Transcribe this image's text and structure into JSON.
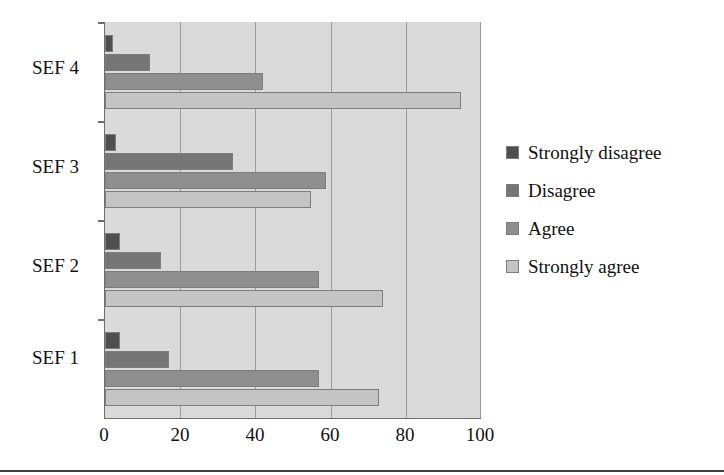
{
  "chart_data": {
    "type": "bar",
    "orientation": "horizontal",
    "title": "",
    "xlabel": "",
    "ylabel": "",
    "categories": [
      "SEF 1",
      "SEF 2",
      "SEF 3",
      "SEF 4"
    ],
    "category_order_top_to_bottom": [
      "SEF 4",
      "SEF 3",
      "SEF 2",
      "SEF 1"
    ],
    "series": [
      {
        "name": "Strongly disagree",
        "color": "#4f4f4f",
        "values": [
          4,
          4,
          3,
          2
        ]
      },
      {
        "name": "Disagree",
        "color": "#757575",
        "values": [
          17,
          15,
          34,
          12
        ]
      },
      {
        "name": "Agree",
        "color": "#8f8f8f",
        "values": [
          57,
          57,
          59,
          42
        ]
      },
      {
        "name": "Strongly agree",
        "color": "#c4c4c4",
        "values": [
          73,
          74,
          55,
          95
        ]
      }
    ],
    "xlim": [
      0,
      100
    ],
    "xticks": [
      0,
      20,
      40,
      60,
      80,
      100
    ],
    "xtick_labels": [
      "0",
      "20",
      "40",
      "60",
      "80",
      "100"
    ],
    "grid": true,
    "grid_axis": "x",
    "legend_position": "right",
    "plot_background": "#dadada",
    "axis_color": "#6f6f6f"
  },
  "legend": {
    "items": [
      {
        "label": "Strongly disagree"
      },
      {
        "label": "Disagree"
      },
      {
        "label": "Agree"
      },
      {
        "label": "Strongly agree"
      }
    ]
  },
  "axes": {
    "x_tick_labels": [
      "0",
      "20",
      "40",
      "60",
      "80",
      "100"
    ],
    "y_tick_labels": [
      "SEF 4",
      "SEF 3",
      "SEF 2",
      "SEF 1"
    ]
  }
}
